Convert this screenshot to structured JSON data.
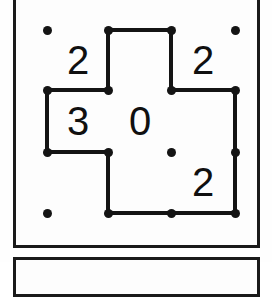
{
  "puzzle": {
    "type": "slitherlink",
    "rows": 3,
    "cols": 3,
    "clue_grid": [
      [
        "2",
        "",
        "2"
      ],
      [
        "3",
        "0",
        ""
      ],
      [
        "",
        "",
        "2"
      ]
    ],
    "clues": [
      {
        "name": "clue-r0c0",
        "value": "2",
        "row": 0,
        "col": 0,
        "x": 78,
        "y": 60
      },
      {
        "name": "clue-r0c2",
        "value": "2",
        "row": 0,
        "col": 2,
        "x": 203,
        "y": 60
      },
      {
        "name": "clue-r1c0",
        "value": "3",
        "row": 1,
        "col": 0,
        "x": 78,
        "y": 121
      },
      {
        "name": "clue-r1c1",
        "value": "0",
        "row": 1,
        "col": 1,
        "x": 140,
        "y": 121
      },
      {
        "name": "clue-r2c2",
        "value": "2",
        "row": 2,
        "col": 2,
        "x": 203,
        "y": 182
      }
    ],
    "dot_columns_x": [
      47,
      108,
      171,
      235
    ],
    "dot_rows_y": [
      30,
      90,
      152,
      213
    ],
    "dots": [
      {
        "name": "dot-r0c0",
        "x": 47,
        "y": 30
      },
      {
        "name": "dot-r0c1",
        "x": 108,
        "y": 30
      },
      {
        "name": "dot-r0c2",
        "x": 171,
        "y": 30
      },
      {
        "name": "dot-r0c3",
        "x": 235,
        "y": 30
      },
      {
        "name": "dot-r1c0",
        "x": 47,
        "y": 90
      },
      {
        "name": "dot-r1c1",
        "x": 108,
        "y": 90
      },
      {
        "name": "dot-r1c2",
        "x": 171,
        "y": 90
      },
      {
        "name": "dot-r1c3",
        "x": 235,
        "y": 90
      },
      {
        "name": "dot-r2c0",
        "x": 47,
        "y": 152
      },
      {
        "name": "dot-r2c1",
        "x": 108,
        "y": 152
      },
      {
        "name": "dot-r2c2",
        "x": 171,
        "y": 152
      },
      {
        "name": "dot-r2c3",
        "x": 235,
        "y": 152
      },
      {
        "name": "dot-r3c0",
        "x": 47,
        "y": 213
      },
      {
        "name": "dot-r3c1",
        "x": 108,
        "y": 213
      },
      {
        "name": "dot-r3c2",
        "x": 171,
        "y": 213
      },
      {
        "name": "dot-r3c3",
        "x": 235,
        "y": 213
      }
    ],
    "drawn_edges_horizontal": [
      {
        "name": "edge-h-r0c1",
        "x": 108,
        "y": 30,
        "length": 63
      },
      {
        "name": "edge-h-r1c0",
        "x": 47,
        "y": 90,
        "length": 61
      },
      {
        "name": "edge-h-r1c2",
        "x": 171,
        "y": 90,
        "length": 64
      },
      {
        "name": "edge-h-r2c0",
        "x": 47,
        "y": 152,
        "length": 61
      },
      {
        "name": "edge-h-r3c1",
        "x": 108,
        "y": 213,
        "length": 63
      },
      {
        "name": "edge-h-r3c2",
        "x": 171,
        "y": 213,
        "length": 64
      }
    ],
    "drawn_edges_vertical": [
      {
        "name": "edge-v-r0c1",
        "x": 108,
        "y": 30,
        "length": 60
      },
      {
        "name": "edge-v-r0c2",
        "x": 171,
        "y": 30,
        "length": 60
      },
      {
        "name": "edge-v-r1c0",
        "x": 47,
        "y": 90,
        "length": 62
      },
      {
        "name": "edge-v-r1c3",
        "x": 235,
        "y": 90,
        "length": 62
      },
      {
        "name": "edge-v-r2c1",
        "x": 108,
        "y": 152,
        "length": 61
      },
      {
        "name": "edge-v-r2c3",
        "x": 235,
        "y": 152,
        "length": 61
      }
    ],
    "colors": {
      "ink": "#141414",
      "frame": "#1a1a1a",
      "paper": "#fdfdfd"
    }
  }
}
